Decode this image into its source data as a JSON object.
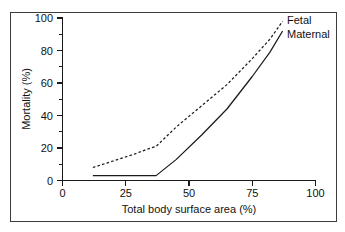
{
  "chart_data": {
    "type": "line",
    "title": "",
    "xlabel": "Total body surface area (%)",
    "ylabel": "Mortality (%)",
    "xlim": [
      0,
      100
    ],
    "ylim": [
      0,
      100
    ],
    "xticks": [
      0,
      25,
      50,
      75,
      100
    ],
    "yticks": [
      0,
      20,
      40,
      60,
      80,
      100
    ],
    "xtick_labels": [
      "0",
      "25",
      "50",
      "75",
      "100"
    ],
    "ytick_labels": [
      "0",
      "20",
      "40",
      "60",
      "80",
      "100"
    ],
    "x_minor_ticks": [
      12.5,
      37.5,
      62.5,
      87.5
    ],
    "y_minor_ticks": [
      10,
      30,
      50,
      70,
      90
    ],
    "grid": false,
    "legend_position": "inline-right-end",
    "series": [
      {
        "name": "Fetal",
        "style": "dashed",
        "color": "#1a1a1a",
        "x": [
          12,
          20,
          28,
          33,
          37,
          45,
          55,
          65,
          75,
          82,
          87
        ],
        "values": [
          8,
          12,
          16,
          19,
          21,
          33,
          46,
          59,
          75,
          87,
          98
        ]
      },
      {
        "name": "Maternal",
        "style": "solid",
        "color": "#1a1a1a",
        "x": [
          12,
          25,
          37,
          45,
          55,
          65,
          75,
          82,
          87
        ],
        "values": [
          3,
          3,
          3,
          13,
          28,
          44,
          64,
          79,
          92
        ]
      }
    ],
    "annotations": [
      {
        "text": "Fetal",
        "x": 89,
        "y": 99
      },
      {
        "text": "Maternal",
        "x": 89,
        "y": 89
      }
    ]
  },
  "axes": {
    "x_title": "Total body surface area (%)",
    "y_title": "Mortality (%)"
  },
  "legend": {
    "fetal_label": "Fetal",
    "maternal_label": "Maternal"
  },
  "x_tick_labels": [
    "0",
    "25",
    "50",
    "75",
    "100"
  ],
  "y_tick_labels": [
    "0",
    "20",
    "40",
    "60",
    "80",
    "100"
  ]
}
